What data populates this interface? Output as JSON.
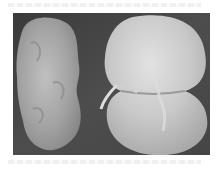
{
  "image": {
    "description": "Photograph of two kidney specimens on a dark gray background: left one shrunken and irregular, right one bivalved and smooth with ureter at hilum",
    "colors": {
      "background": "#4a4a4a",
      "left_specimen": "#a9a9a9",
      "right_specimen": "#c8c8c8",
      "page": "#ffffff"
    }
  }
}
